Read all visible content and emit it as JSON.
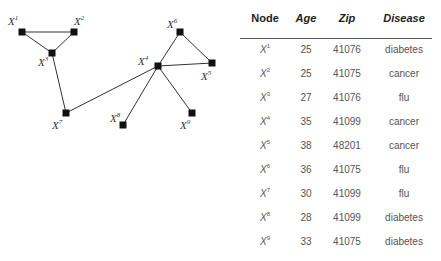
{
  "graph": {
    "nodes": [
      {
        "id": "X1",
        "base": "X",
        "sup": "1",
        "x": 22,
        "y": 32,
        "lx": 8,
        "ly": 25
      },
      {
        "id": "X2",
        "base": "X",
        "sup": "2",
        "x": 74,
        "y": 32,
        "lx": 74,
        "ly": 25
      },
      {
        "id": "X3",
        "base": "X",
        "sup": "3",
        "x": 52,
        "y": 53,
        "lx": 38,
        "ly": 66
      },
      {
        "id": "X4",
        "base": "X",
        "sup": "4",
        "x": 158,
        "y": 66,
        "lx": 138,
        "ly": 65
      },
      {
        "id": "X5",
        "base": "X",
        "sup": "5",
        "x": 212,
        "y": 63,
        "lx": 201,
        "ly": 80
      },
      {
        "id": "X6",
        "base": "X",
        "sup": "6",
        "x": 180,
        "y": 32,
        "lx": 167,
        "ly": 28
      },
      {
        "id": "X7",
        "base": "X",
        "sup": "7",
        "x": 66,
        "y": 113,
        "lx": 52,
        "ly": 129
      },
      {
        "id": "X8",
        "base": "X",
        "sup": "8",
        "x": 123,
        "y": 125,
        "lx": 110,
        "ly": 122
      },
      {
        "id": "X9",
        "base": "X",
        "sup": "9",
        "x": 192,
        "y": 113,
        "lx": 180,
        "ly": 129
      }
    ],
    "edges": [
      [
        "X1",
        "X2"
      ],
      [
        "X1",
        "X3"
      ],
      [
        "X2",
        "X3"
      ],
      [
        "X3",
        "X7"
      ],
      [
        "X7",
        "X4"
      ],
      [
        "X4",
        "X6"
      ],
      [
        "X6",
        "X5"
      ],
      [
        "X4",
        "X5"
      ],
      [
        "X4",
        "X8"
      ],
      [
        "X4",
        "X9"
      ]
    ]
  },
  "table": {
    "headers": {
      "node": "Node",
      "age": "Age",
      "zip": "Zip",
      "disease": "Disease"
    },
    "rows": [
      {
        "base": "X",
        "sup": "1",
        "age": "25",
        "zip": "41076",
        "disease": "diabetes"
      },
      {
        "base": "X",
        "sup": "2",
        "age": "25",
        "zip": "41075",
        "disease": "cancer"
      },
      {
        "base": "X",
        "sup": "3",
        "age": "27",
        "zip": "41076",
        "disease": "flu"
      },
      {
        "base": "X",
        "sup": "4",
        "age": "35",
        "zip": "41099",
        "disease": "cancer"
      },
      {
        "base": "X",
        "sup": "5",
        "age": "38",
        "zip": "48201",
        "disease": "cancer"
      },
      {
        "base": "X",
        "sup": "6",
        "age": "36",
        "zip": "41075",
        "disease": "flu"
      },
      {
        "base": "X",
        "sup": "7",
        "age": "30",
        "zip": "41099",
        "disease": "flu"
      },
      {
        "base": "X",
        "sup": "8",
        "age": "28",
        "zip": "41099",
        "disease": "diabetes"
      },
      {
        "base": "X",
        "sup": "9",
        "age": "33",
        "zip": "41075",
        "disease": "diabetes"
      }
    ]
  }
}
